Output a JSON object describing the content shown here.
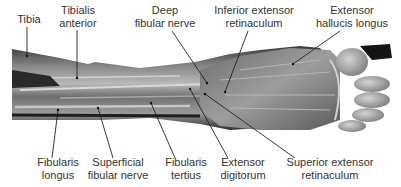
{
  "figure": {
    "background": "#ffffff",
    "line_color": "#222222",
    "text_color": "#333333"
  },
  "labels_top": [
    {
      "id": "tibia",
      "lines": [
        "Tibia"
      ],
      "x": 29,
      "y": 13,
      "leader": [
        [
          27,
          27
        ],
        [
          27,
          56
        ]
      ]
    },
    {
      "id": "tibialis-anterior",
      "lines": [
        "Tibialis",
        "anterior"
      ],
      "x": 78,
      "y": 4,
      "leader": [
        [
          77,
          30
        ],
        [
          77,
          78
        ]
      ]
    },
    {
      "id": "deep-fibular-nerve",
      "lines": [
        "Deep",
        "fibular nerve"
      ],
      "x": 165,
      "y": 4,
      "leader": [
        [
          172,
          31
        ],
        [
          207,
          83
        ]
      ]
    },
    {
      "id": "inferior-extensor-retinaculum",
      "lines": [
        "Inferior extensor",
        "retinaculum"
      ],
      "x": 254,
      "y": 4,
      "leader": [
        [
          248,
          31
        ],
        [
          225,
          92
        ]
      ]
    },
    {
      "id": "extensor-hallucis-longus",
      "lines": [
        "Extensor",
        "hallucis longus"
      ],
      "x": 352,
      "y": 4,
      "leader": [
        [
          340,
          31
        ],
        [
          293,
          64
        ]
      ]
    }
  ],
  "labels_bottom": [
    {
      "id": "fibularis-longus",
      "lines": [
        "Fibularis",
        "longus"
      ],
      "x": 58,
      "y": 156,
      "leader": [
        [
          52,
          158
        ],
        [
          58,
          110
        ]
      ]
    },
    {
      "id": "superficial-fibular-nerve",
      "lines": [
        "Superficial",
        "fibular nerve"
      ],
      "x": 118,
      "y": 156,
      "leader": [
        [
          113,
          158
        ],
        [
          98,
          108
        ]
      ]
    },
    {
      "id": "fibularis-tertius",
      "lines": [
        "Fibularis",
        "tertius"
      ],
      "x": 186,
      "y": 156,
      "leader": [
        [
          175,
          158
        ],
        [
          151,
          103
        ]
      ]
    },
    {
      "id": "extensor-digitorum",
      "lines": [
        "Extensor",
        "digitorum"
      ],
      "x": 243,
      "y": 156,
      "leader": [
        [
          228,
          158
        ],
        [
          190,
          89
        ]
      ]
    },
    {
      "id": "superior-extensor-retinaculum",
      "lines": [
        "Superior extensor",
        "retinaculum"
      ],
      "x": 330,
      "y": 156,
      "leader": [
        [
          295,
          158
        ],
        [
          205,
          94
        ]
      ]
    }
  ]
}
